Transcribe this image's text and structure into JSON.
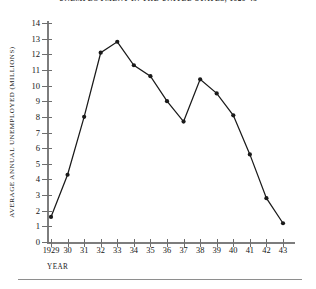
{
  "figure": {
    "running_head": "UNEMPLOYMENT IN THE UNITED STATES, 1929-43",
    "xtitle": "YEAR",
    "ytitle": "AVERAGE ANNUAL UNEMPLOYED (MILLIONS)"
  },
  "chart_data": {
    "type": "line",
    "title": "",
    "xlabel": "YEAR",
    "ylabel": "AVERAGE ANNUAL UNEMPLOYED (MILLIONS)",
    "xlim": [
      1929,
      1943
    ],
    "ylim": [
      0,
      14
    ],
    "grid": false,
    "legend": false,
    "marker": "filled-circle",
    "line_color": "#1a1a1a",
    "x": [
      1929,
      1930,
      1931,
      1932,
      1933,
      1934,
      1935,
      1936,
      1937,
      1938,
      1939,
      1940,
      1941,
      1942,
      1943
    ],
    "categories": [
      "1929",
      "30",
      "31",
      "32",
      "33",
      "34",
      "35",
      "36",
      "37",
      "38",
      "39",
      "40",
      "41",
      "42",
      "43"
    ],
    "values": [
      1.6,
      4.3,
      8.0,
      12.1,
      12.8,
      11.3,
      10.6,
      9.0,
      7.7,
      10.4,
      9.5,
      8.1,
      5.6,
      2.8,
      1.2
    ],
    "ytick_labels": [
      "0",
      "1",
      "2",
      "3",
      "4",
      "5",
      "6",
      "7",
      "8",
      "9",
      "10",
      "11",
      "12",
      "13",
      "14"
    ],
    "ytick_values": [
      0,
      1,
      2,
      3,
      4,
      5,
      6,
      7,
      8,
      9,
      10,
      11,
      12,
      13,
      14
    ]
  }
}
